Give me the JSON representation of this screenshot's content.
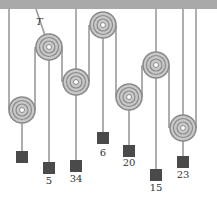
{
  "diagram": {
    "tension_label": "T",
    "colors": {
      "ceiling": "#a9a9a9",
      "string": "#9a9a9a",
      "pulley_outer": "#8a8a8a",
      "pulley_fill": "#c8c8c8",
      "block": "#4a4a4a"
    },
    "pulleys": [
      {
        "id": "p1"
      },
      {
        "id": "p2"
      },
      {
        "id": "p3"
      },
      {
        "id": "p4"
      },
      {
        "id": "p5"
      },
      {
        "id": "p6"
      },
      {
        "id": "p7"
      }
    ],
    "masses": [
      {
        "id": "m1",
        "label": ""
      },
      {
        "id": "m2",
        "label": "5"
      },
      {
        "id": "m3",
        "label": "34"
      },
      {
        "id": "m4",
        "label": "6"
      },
      {
        "id": "m5",
        "label": "20"
      },
      {
        "id": "m6",
        "label": "15"
      },
      {
        "id": "m7",
        "label": "23"
      }
    ]
  }
}
